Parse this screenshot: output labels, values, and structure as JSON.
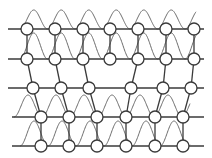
{
  "diagram": {
    "title": "",
    "colors": {
      "line": "#3a3a3a",
      "wave": "#6a6a6a",
      "node_fill": "#ffffff"
    },
    "node_radius": 6,
    "rows": [
      {
        "y": 29,
        "line": [
          8,
          204
        ],
        "nodes": [
          27,
          55,
          83,
          110,
          138,
          166,
          194
        ]
      },
      {
        "y": 59,
        "line": [
          8,
          204
        ],
        "nodes": [
          27,
          55,
          83,
          110,
          138,
          166,
          194
        ]
      },
      {
        "y": 88,
        "line": [
          8,
          204
        ],
        "nodes": [
          33,
          61,
          89,
          131,
          163,
          191
        ]
      },
      {
        "y": 117,
        "line": [
          12,
          204
        ],
        "nodes": [
          41,
          69,
          97,
          126,
          155,
          183
        ]
      },
      {
        "y": 146,
        "line": [
          12,
          204
        ],
        "nodes": [
          41,
          69,
          97,
          126,
          155,
          183
        ]
      }
    ],
    "links": [
      [
        0,
        0,
        1,
        0
      ],
      [
        0,
        1,
        1,
        1
      ],
      [
        0,
        2,
        1,
        2
      ],
      [
        0,
        3,
        1,
        3
      ],
      [
        0,
        4,
        1,
        4
      ],
      [
        0,
        5,
        1,
        5
      ],
      [
        0,
        6,
        1,
        6
      ],
      [
        1,
        0,
        2,
        0
      ],
      [
        1,
        1,
        2,
        1
      ],
      [
        1,
        2,
        2,
        2
      ],
      [
        1,
        4,
        2,
        3
      ],
      [
        1,
        5,
        2,
        4
      ],
      [
        1,
        6,
        2,
        5
      ],
      [
        2,
        0,
        3,
        0
      ],
      [
        2,
        1,
        3,
        1
      ],
      [
        2,
        2,
        3,
        2
      ],
      [
        2,
        3,
        3,
        3
      ],
      [
        2,
        4,
        3,
        4
      ],
      [
        2,
        5,
        3,
        5
      ],
      [
        3,
        0,
        4,
        0
      ],
      [
        3,
        1,
        4,
        1
      ],
      [
        3,
        2,
        4,
        2
      ],
      [
        3,
        3,
        4,
        3
      ],
      [
        3,
        4,
        4,
        4
      ],
      [
        3,
        5,
        4,
        5
      ]
    ],
    "wave_bands": [
      {
        "y_base": 29,
        "y_peak": 10,
        "x_start": 20,
        "x_end": 196,
        "period": 27.5
      },
      {
        "y_base": 59,
        "y_peak": 33,
        "x_start": 20,
        "x_end": 196,
        "period": 27.5
      },
      {
        "y_base": 117,
        "y_peak": 95,
        "x_start": 14,
        "x_end": 190,
        "period": 28
      },
      {
        "y_base": 146,
        "y_peak": 121,
        "x_start": 20,
        "x_end": 190,
        "period": 28
      }
    ]
  }
}
